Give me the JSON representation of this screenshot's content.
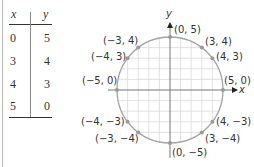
{
  "table": {
    "headers": [
      "x",
      "y"
    ],
    "rows": [
      {
        "x": "0",
        "y": "5"
      },
      {
        "x": "3",
        "y": "4"
      },
      {
        "x": "4",
        "y": "3"
      },
      {
        "x": "5",
        "y": "0"
      }
    ]
  },
  "graph": {
    "x_axis_label": "x",
    "y_axis_label": "y",
    "circle": {
      "center": [
        0,
        0
      ],
      "radius": 5
    },
    "points": [
      {
        "x": 0,
        "y": 5,
        "label": "(0, 5)"
      },
      {
        "x": 3,
        "y": 4,
        "label": "(3, 4)"
      },
      {
        "x": 4,
        "y": 3,
        "label": "(4, 3)"
      },
      {
        "x": 5,
        "y": 0,
        "label": "(5, 0)"
      },
      {
        "x": 4,
        "y": -3,
        "label": "(4, −3)"
      },
      {
        "x": 3,
        "y": -4,
        "label": "(3, −4)"
      },
      {
        "x": 0,
        "y": -5,
        "label": "(0, −5)"
      },
      {
        "x": -3,
        "y": 4,
        "label": "(−3, 4)"
      },
      {
        "x": -4,
        "y": 3,
        "label": "(−4, 3)"
      },
      {
        "x": -5,
        "y": 0,
        "label": "(−5, 0)"
      },
      {
        "x": -4,
        "y": -3,
        "label": "(−4, −3)"
      },
      {
        "x": -3,
        "y": -4,
        "label": "(−3, −4)"
      }
    ],
    "colors": {
      "circle": "#a3a3a3",
      "grid": "#d9d9d9",
      "axis": "#777777",
      "point": "#9a9a9a",
      "text": "#333333"
    }
  }
}
